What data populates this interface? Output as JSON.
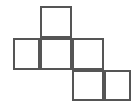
{
  "figure": {
    "background_color": "#ffffff",
    "stroke_color": "#555555",
    "fill_color": "#ffffff",
    "stroke_width": 2,
    "canvas": {
      "width": 140,
      "height": 109
    },
    "grid": {
      "cell_size": 32,
      "origin_x": 13,
      "origin_y": 6,
      "columns": 4,
      "rows": 3
    },
    "cells": [
      {
        "name": "top-square",
        "row": 0,
        "col": 1,
        "x": 40,
        "y": 6,
        "w": 32,
        "h": 32
      },
      {
        "name": "middle-left-square",
        "row": 1,
        "col": 0,
        "x": 13,
        "y": 38,
        "w": 27,
        "h": 32
      },
      {
        "name": "middle-center-square",
        "row": 1,
        "col": 1,
        "x": 40,
        "y": 38,
        "w": 32,
        "h": 32
      },
      {
        "name": "middle-right-square",
        "row": 1,
        "col": 2,
        "x": 72,
        "y": 38,
        "w": 32,
        "h": 32
      },
      {
        "name": "bottom-left-square",
        "row": 2,
        "col": 2,
        "x": 72,
        "y": 70,
        "w": 32,
        "h": 31
      },
      {
        "name": "bottom-right-square",
        "row": 2,
        "col": 3,
        "x": 104,
        "y": 70,
        "w": 27,
        "h": 31
      }
    ]
  }
}
